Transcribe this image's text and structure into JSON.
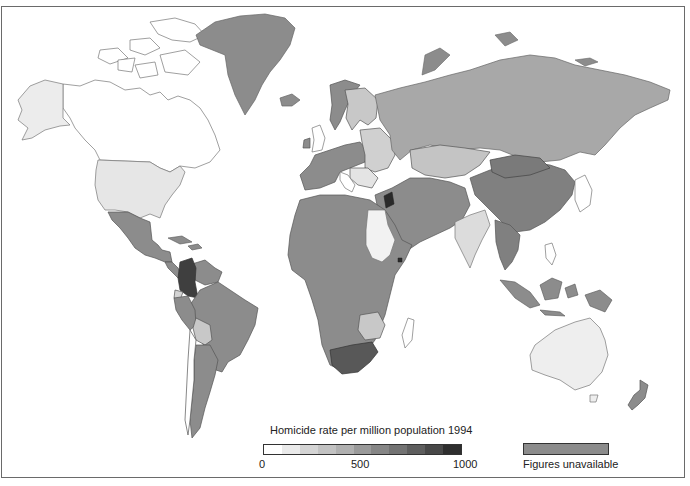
{
  "map": {
    "title": "Homicide rate per million population 1994",
    "colors": {
      "no_data": "#8c8c8c",
      "border": "#555555",
      "outline": "#777777",
      "ocean": "#ffffff"
    },
    "regions": [
      {
        "name": "Canada",
        "shade": "#ffffff"
      },
      {
        "name": "Alaska (USA)",
        "shade": "#ececec"
      },
      {
        "name": "USA",
        "shade": "#e6e6e6"
      },
      {
        "name": "Greenland",
        "shade": "#8c8c8c"
      },
      {
        "name": "Mexico",
        "shade": "#8c8c8c"
      },
      {
        "name": "Central America",
        "shade": "#8c8c8c"
      },
      {
        "name": "Colombia",
        "shade": "#3f3f3f"
      },
      {
        "name": "Venezuela",
        "shade": "#8c8c8c"
      },
      {
        "name": "Ecuador",
        "shade": "#d4d4d4"
      },
      {
        "name": "Brazil",
        "shade": "#8c8c8c"
      },
      {
        "name": "Bolivia",
        "shade": "#c8c8c8"
      },
      {
        "name": "Chile",
        "shade": "#ffffff"
      },
      {
        "name": "Argentina",
        "shade": "#8c8c8c"
      },
      {
        "name": "Russia",
        "shade": "#a8a8a8"
      },
      {
        "name": "Kazakhstan",
        "shade": "#c4c4c4"
      },
      {
        "name": "China",
        "shade": "#808080"
      },
      {
        "name": "Mongolia",
        "shade": "#7a7a7a"
      },
      {
        "name": "India",
        "shade": "#dcdcdc"
      },
      {
        "name": "Southeast Asia",
        "shade": "#808080"
      },
      {
        "name": "Japan",
        "shade": "#ffffff"
      },
      {
        "name": "Australia",
        "shade": "#eeeeee"
      },
      {
        "name": "New Zealand",
        "shade": "#8c8c8c"
      },
      {
        "name": "Africa",
        "shade": "#8c8c8c"
      },
      {
        "name": "Egypt/Sudan",
        "shade": "#f2f2f2"
      },
      {
        "name": "South Africa",
        "shade": "#585858"
      },
      {
        "name": "Zimbabwe/Botswana",
        "shade": "#c8c8c8"
      },
      {
        "name": "Madagascar",
        "shade": "#ffffff"
      },
      {
        "name": "Middle East",
        "shade": "#8c8c8c"
      },
      {
        "name": "Israel/Jordan",
        "shade": "#2a2a2a"
      },
      {
        "name": "Western Europe",
        "shade": "#8c8c8c"
      },
      {
        "name": "Eastern Europe",
        "shade": "#d0d0d0"
      },
      {
        "name": "Scandinavia",
        "shade": "#c8c8c8"
      }
    ]
  },
  "legend": {
    "title": "Homicide rate per million population 1994",
    "scale_min": "0",
    "scale_mid": "500",
    "scale_max": "1000",
    "swatches": [
      "#ffffff",
      "#eaeaea",
      "#d4d4d4",
      "#c2c2c2",
      "#b0b0b0",
      "#9a9a9a",
      "#868686",
      "#737373",
      "#5e5e5e",
      "#484848",
      "#2e2e2e"
    ],
    "unavailable_label": "Figures unavailable",
    "unavailable_color": "#8c8c8c"
  }
}
